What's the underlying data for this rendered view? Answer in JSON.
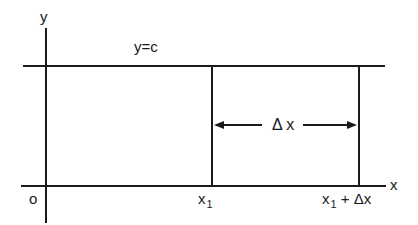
{
  "diagram": {
    "axes": {
      "y_label": "y",
      "x_label": "x",
      "origin_label": "o"
    },
    "constant_line": {
      "label": "y=c"
    },
    "interval": {
      "left_label_main": "x",
      "left_label_sub": "1",
      "right_label_main": "x",
      "right_label_sub": "1",
      "right_label_rest": "+ Δx",
      "width_label": "Δ x"
    },
    "colors": {
      "ink": "#1a1a1a",
      "background": "#ffffff"
    }
  }
}
